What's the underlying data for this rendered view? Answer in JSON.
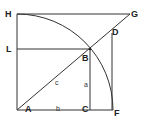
{
  "diagram": {
    "points": {
      "H": "H",
      "G": "G",
      "L": "L",
      "B": "B",
      "D": "D",
      "A": "A",
      "C": "C",
      "F": "F"
    },
    "segments": {
      "hypotenuse": "c",
      "vertical": "a",
      "base": "b"
    },
    "line_color": "#333333"
  }
}
